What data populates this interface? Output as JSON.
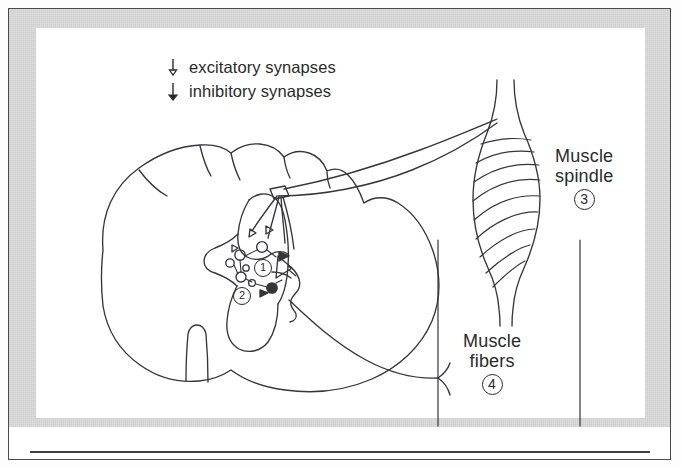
{
  "figure": {
    "kind": "spinal-reflex-circuit-diagram",
    "legend": {
      "items": [
        {
          "symbol": "excitatory-synapse-symbol",
          "label": "excitatory synapses"
        },
        {
          "symbol": "inhibitory-synapse-symbol",
          "label": "inhibitory synapses"
        }
      ]
    },
    "labels": [
      {
        "id": "muscle-spindle",
        "line1": "Muscle",
        "line2": "spindle",
        "marker": "3"
      },
      {
        "id": "muscle-fibers",
        "line1": "Muscle",
        "line2": "fibers",
        "marker": "4"
      }
    ],
    "inline_markers": [
      {
        "id": "alpha-motoneuron-marker",
        "marker": "1"
      },
      {
        "id": "renshaw-interneuron-marker",
        "marker": "2"
      }
    ],
    "structures": [
      "spinal-cord-cross-section",
      "gray-matter-butterfly",
      "ventral-median-fissure",
      "dorsal-root-entry",
      "sensory-afferent-fibers",
      "motor-efferent-fiber",
      "interneuron-pool",
      "muscle-spindle-body",
      "muscle-fiber-lines"
    ],
    "colors": {
      "ink": "#2a2a2a",
      "line": "#3c3c3c",
      "paper": "#ffffff",
      "mat": "#dedede",
      "page": "#f3f3f3"
    }
  }
}
